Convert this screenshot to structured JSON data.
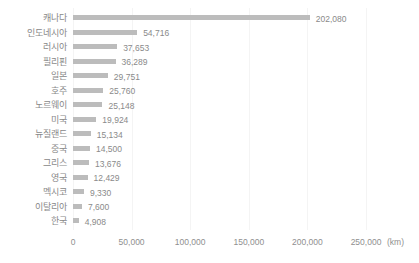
{
  "chart_data": {
    "type": "bar",
    "orientation": "horizontal",
    "title": "",
    "xlabel": "",
    "ylabel": "",
    "x_unit": "(km)",
    "xlim": [
      0,
      250000
    ],
    "grid": true,
    "legend": false,
    "categories": [
      "캐나다",
      "인도네시아",
      "러시아",
      "필리핀",
      "일본",
      "호주",
      "노르웨이",
      "미국",
      "뉴질랜드",
      "중국",
      "그리스",
      "영국",
      "멕시코",
      "이탈리아",
      "한국"
    ],
    "values": [
      202080,
      54716,
      37653,
      36289,
      29751,
      25760,
      25148,
      19924,
      15134,
      14500,
      13676,
      12429,
      9330,
      7600,
      4908
    ],
    "value_labels": [
      "202,080",
      "54,716",
      "37,653",
      "36,289",
      "29,751",
      "25,760",
      "25,148",
      "19,924",
      "15,134",
      "14,500",
      "13,676",
      "12,429",
      "9,330",
      "7,600",
      "4,908"
    ],
    "x_tick_values": [
      0,
      50000,
      100000,
      150000,
      200000,
      250000
    ],
    "x_tick_labels": [
      "0",
      "50,000",
      "100,000",
      "150,000",
      "200,000",
      "250,000"
    ],
    "colors": {
      "bar": "#bcbcbc",
      "category_text": "#888888",
      "value_text": "#8a8a8a",
      "axis_text": "#8f8f8f",
      "gridline": "#f4f4f4",
      "background": "#ffffff"
    }
  }
}
